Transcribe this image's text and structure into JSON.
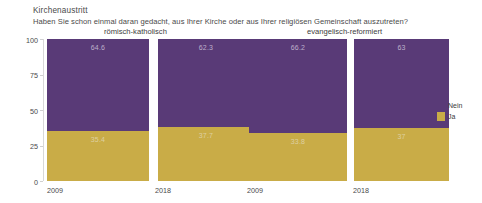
{
  "chart_data": {
    "type": "bar",
    "title": "Kirchenaustritt",
    "subtitle": "Haben Sie schon einmal daran gedacht, aus Ihrer Kirche oder aus Ihrer religiösen Gemeinschaft auszutreten?",
    "xlabel": "",
    "ylabel": "Prozent",
    "ylim": [
      0,
      100
    ],
    "yticks": [
      0,
      25,
      50,
      75,
      100
    ],
    "ytick_labels": [
      "0",
      "25",
      "50",
      "75",
      "100"
    ],
    "grid": false,
    "stacked": true,
    "stack_total": 100,
    "legend_position": "right",
    "groups": [
      {
        "label": "römisch-katholisch",
        "categories": [
          "2009",
          "2018"
        ]
      },
      {
        "label": "evangelisch-reformiert",
        "categories": [
          "2009",
          "2018"
        ]
      }
    ],
    "categories": [
      "2009",
      "2018",
      "2009",
      "2018"
    ],
    "series": [
      {
        "name": "Nein",
        "color": "#593A77",
        "values": [
          64.6,
          62.3,
          66.2,
          63
        ]
      },
      {
        "name": "Ja",
        "color": "#C9AC47",
        "values": [
          35.4,
          37.7,
          33.8,
          37
        ]
      }
    ],
    "bars": [
      {
        "group": "römisch-katholisch",
        "category": "2009",
        "nein": 64.6,
        "ja": 35.4,
        "nein_label": "64.6",
        "ja_label": "35.4"
      },
      {
        "group": "römisch-katholisch",
        "category": "2018",
        "nein": 62.3,
        "ja": 37.7,
        "nein_label": "62.3",
        "ja_label": "37.7"
      },
      {
        "group": "evangelisch-reformiert",
        "category": "2009",
        "nein": 66.2,
        "ja": 33.8,
        "nein_label": "66.2",
        "ja_label": "33.8"
      },
      {
        "group": "evangelisch-reformiert",
        "category": "2018",
        "nein": 63,
        "ja": 37,
        "nein_label": "63",
        "ja_label": "37"
      }
    ],
    "legend": [
      {
        "label": "Nein",
        "color": "#593A77"
      },
      {
        "label": "Ja",
        "color": "#C9AC47"
      }
    ]
  }
}
